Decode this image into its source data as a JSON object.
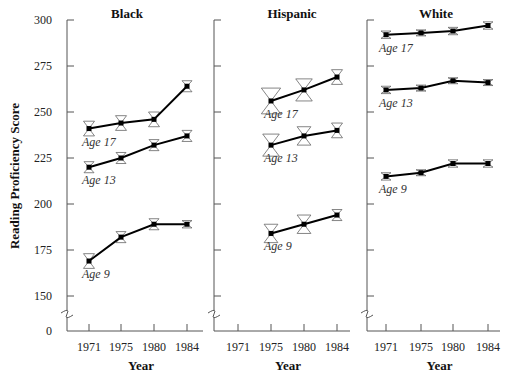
{
  "chart_data": {
    "type": "line",
    "ylabel": "Reading Proficiency Score",
    "xlabel": "Year",
    "yticks": [
      0,
      150,
      175,
      200,
      225,
      250,
      275,
      300
    ],
    "ylim": [
      150,
      300
    ],
    "axis_break": true,
    "x_categories": [
      "1971",
      "1975",
      "1980",
      "1984"
    ],
    "panels": [
      {
        "title": "Black",
        "series": [
          {
            "name": "Age 17",
            "x": [
              "1971",
              "1975",
              "1980",
              "1984"
            ],
            "values": [
              241,
              244,
              246,
              264
            ],
            "err": [
              4,
              4,
              4,
              3
            ]
          },
          {
            "name": "Age 13",
            "x": [
              "1971",
              "1975",
              "1980",
              "1984"
            ],
            "values": [
              220,
              225,
              232,
              237
            ],
            "err": [
              3,
              3,
              3,
              3
            ]
          },
          {
            "name": "Age 9",
            "x": [
              "1971",
              "1975",
              "1980",
              "1984"
            ],
            "values": [
              169,
              182,
              189,
              189
            ],
            "err": [
              4,
              3,
              3,
              2
            ]
          }
        ]
      },
      {
        "title": "Hispanic",
        "series": [
          {
            "name": "Age 17",
            "x": [
              "1975",
              "1980",
              "1984"
            ],
            "values": [
              256,
              262,
              269
            ],
            "err": [
              7,
              6,
              4
            ]
          },
          {
            "name": "Age 13",
            "x": [
              "1975",
              "1980",
              "1984"
            ],
            "values": [
              232,
              237,
              240
            ],
            "err": [
              6,
              5,
              4
            ]
          },
          {
            "name": "Age 9",
            "x": [
              "1975",
              "1980",
              "1984"
            ],
            "values": [
              184,
              189,
              194
            ],
            "err": [
              5,
              5,
              3
            ]
          }
        ]
      },
      {
        "title": "White",
        "series": [
          {
            "name": "Age 17",
            "x": [
              "1971",
              "1975",
              "1980",
              "1984"
            ],
            "values": [
              292,
              293,
              294,
              297
            ],
            "err": [
              2,
              1,
              2,
              2
            ]
          },
          {
            "name": "Age 13",
            "x": [
              "1971",
              "1975",
              "1980",
              "1984"
            ],
            "values": [
              262,
              263,
              267,
              266
            ],
            "err": [
              2,
              1,
              1,
              1
            ]
          },
          {
            "name": "Age 9",
            "x": [
              "1971",
              "1975",
              "1980",
              "1984"
            ],
            "values": [
              215,
              217,
              222,
              222
            ],
            "err": [
              2,
              1,
              2,
              2
            ]
          }
        ]
      }
    ]
  },
  "colors": {
    "line": "#000000",
    "axis": "#555555",
    "error_bar": "#666666"
  }
}
